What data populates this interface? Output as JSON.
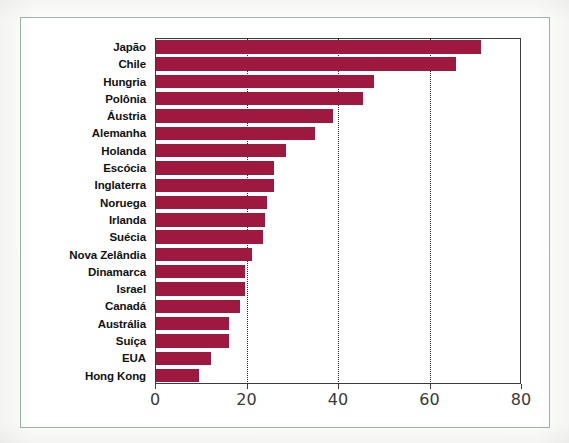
{
  "chart_data": {
    "type": "bar",
    "orientation": "horizontal",
    "title": "",
    "subtitle": "",
    "xlabel": "",
    "ylabel": "",
    "xlim": [
      0,
      80
    ],
    "ylim": null,
    "grid": "vertical-dotted",
    "legend": null,
    "bar_color": "#9e1840",
    "axis_color": "#3c3c3c",
    "frame_color": "#9fb3a6",
    "xticks": [
      0,
      20,
      40,
      60,
      80
    ],
    "xticklabels": [
      "0",
      "20",
      "40",
      "60",
      "80"
    ],
    "categories": [
      "Japão",
      "Chile",
      "Hungria",
      "Polônia",
      "Áustria",
      "Alemanha",
      "Holanda",
      "Escócia",
      "Inglaterra",
      "Noruega",
      "Irlanda",
      "Suécia",
      "Nova Zelândia",
      "Dinamarca",
      "Israel",
      "Canadá",
      "Austrália",
      "Suíça",
      "EUA",
      "Hong Kong"
    ],
    "values": [
      71.5,
      66,
      48,
      45.5,
      39,
      35,
      28.5,
      26,
      26,
      24.5,
      24,
      23.5,
      21,
      19.5,
      19.5,
      18.5,
      16,
      16,
      12,
      9.5
    ]
  }
}
